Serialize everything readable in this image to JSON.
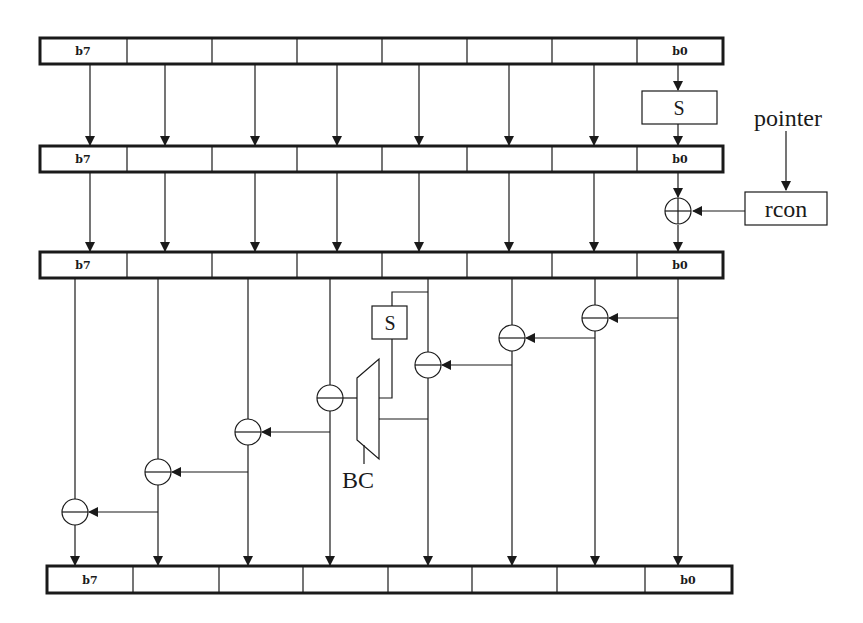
{
  "diagram": {
    "type": "block-diagram",
    "registers": [
      {
        "id": "reg1",
        "msb_label": "b7",
        "lsb_label": "b0",
        "cells": 8
      },
      {
        "id": "reg2",
        "msb_label": "b7",
        "lsb_label": "b0",
        "cells": 8
      },
      {
        "id": "reg3",
        "msb_label": "b7",
        "lsb_label": "b0",
        "cells": 8
      },
      {
        "id": "reg4",
        "msb_label": "b7",
        "lsb_label": "b0",
        "cells": 8
      }
    ],
    "blocks": {
      "sbox_top": "S",
      "sbox_mid": "S",
      "rcon": "rcon",
      "pointer": "pointer",
      "mux": "BC"
    },
    "xor_count": 8,
    "colors": {
      "line": "#1a1a1a",
      "background": "#ffffff"
    }
  }
}
